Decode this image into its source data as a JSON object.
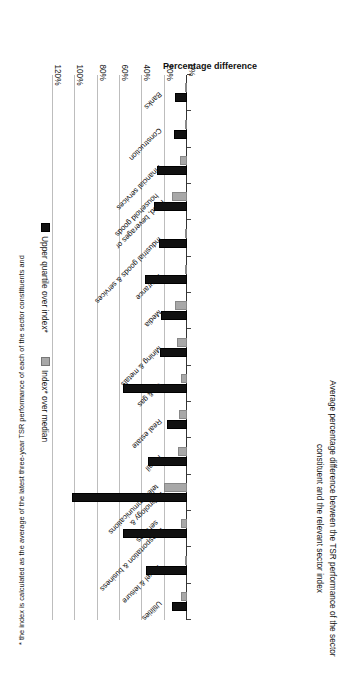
{
  "figure": {
    "title": "Average percentage difference between the TSR performance of the sector constituent and the relevant sector index",
    "axis_title": "Percentage difference",
    "footnote": "* the index is calculated as the average of the latest three-year TSR performance of each of the sector constituents and"
  },
  "legend": {
    "items": [
      {
        "label": "Index* over median",
        "color": "#a8a8a8",
        "icon": "square-swatch-icon"
      },
      {
        "label": "Upper quartile over index*",
        "color": "#111111",
        "icon": "square-swatch-icon"
      }
    ]
  },
  "chart_data": {
    "type": "bar",
    "orientation": "horizontal",
    "title": "Average percentage difference between the TSR performance of the sector constituent and the relevant sector index",
    "xlabel": "",
    "ylabel": "Percentage difference",
    "ylim": [
      0,
      120
    ],
    "tick_labels": [
      "0%",
      "20%",
      "40%",
      "60%",
      "80%",
      "100%",
      "120%"
    ],
    "tick_values": [
      0,
      20,
      40,
      60,
      80,
      100,
      120
    ],
    "grid": true,
    "legend_position": "right",
    "categories": [
      "Banks",
      "Construction",
      "Financial services",
      "Food, beverages or household goods",
      "Industrial goods & services",
      "Insurance",
      "Media",
      "Mining & metals",
      "Oil & gas",
      "Real estate",
      "Retail",
      "Technology & telecommunications",
      "Transportation & business services",
      "Travel & leisure",
      "Utilities"
    ],
    "series": [
      {
        "name": "Index* over median",
        "color": "#a8a8a8",
        "values": [
          1,
          2,
          6,
          13,
          1,
          2,
          11,
          9,
          5,
          7,
          8,
          21,
          5,
          2,
          5
        ]
      },
      {
        "name": "Upper quartile over index*",
        "color": "#111111",
        "values": [
          11,
          12,
          27,
          30,
          25,
          38,
          23,
          24,
          57,
          18,
          35,
          103,
          57,
          37,
          13
        ]
      }
    ]
  }
}
